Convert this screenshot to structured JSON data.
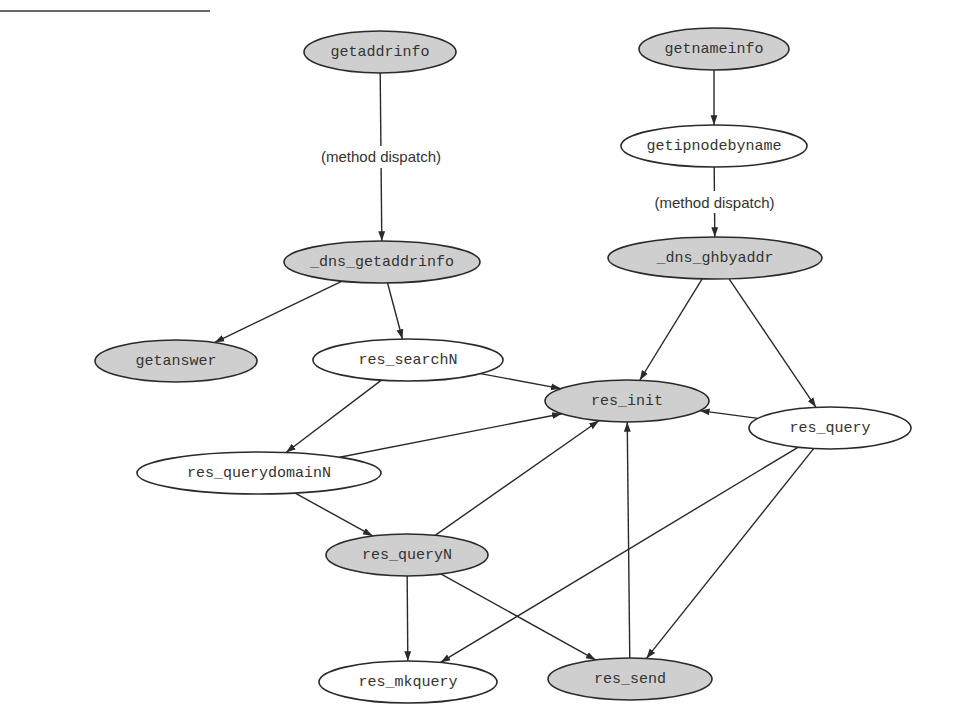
{
  "diagram": {
    "type": "call-graph",
    "colors": {
      "shaded_fill": "#cfcfcf",
      "plain_fill": "#ffffff",
      "stroke": "#2a2a2a",
      "text": "#333333"
    },
    "nodes": [
      {
        "id": "getaddrinfo",
        "label": "getaddrinfo",
        "shaded": true,
        "cx": 380,
        "cy": 52,
        "rx": 76,
        "ry": 21
      },
      {
        "id": "getnameinfo",
        "label": "getnameinfo",
        "shaded": true,
        "cx": 714,
        "cy": 49,
        "rx": 75,
        "ry": 21
      },
      {
        "id": "getipnodebyname",
        "label": "getipnodebyname",
        "shaded": false,
        "cx": 714,
        "cy": 146,
        "rx": 93,
        "ry": 21
      },
      {
        "id": "_dns_getaddrinfo",
        "label": "_dns_getaddrinfo",
        "shaded": true,
        "cx": 382,
        "cy": 262,
        "rx": 98,
        "ry": 21
      },
      {
        "id": "_dns_ghbyaddr",
        "label": "_dns_ghbyaddr",
        "shaded": true,
        "cx": 715,
        "cy": 258,
        "rx": 107,
        "ry": 21
      },
      {
        "id": "getanswer",
        "label": "getanswer",
        "shaded": true,
        "cx": 176,
        "cy": 361,
        "rx": 81,
        "ry": 21
      },
      {
        "id": "res_searchN",
        "label": "res_searchN",
        "shaded": false,
        "cx": 408,
        "cy": 360,
        "rx": 95,
        "ry": 21
      },
      {
        "id": "res_init",
        "label": "res_init",
        "shaded": true,
        "cx": 627,
        "cy": 401,
        "rx": 82,
        "ry": 21
      },
      {
        "id": "res_query",
        "label": "res_query",
        "shaded": false,
        "cx": 830,
        "cy": 428,
        "rx": 81,
        "ry": 21
      },
      {
        "id": "res_querydomainN",
        "label": "res_querydomainN",
        "shaded": false,
        "cx": 259,
        "cy": 473,
        "rx": 122,
        "ry": 21
      },
      {
        "id": "res_queryN",
        "label": "res_queryN",
        "shaded": true,
        "cx": 407,
        "cy": 555,
        "rx": 81,
        "ry": 21
      },
      {
        "id": "res_mkquery",
        "label": "res_mkquery",
        "shaded": false,
        "cx": 408,
        "cy": 682,
        "rx": 89,
        "ry": 21
      },
      {
        "id": "res_send",
        "label": "res_send",
        "shaded": true,
        "cx": 630,
        "cy": 679,
        "rx": 82,
        "ry": 21
      }
    ],
    "edges": [
      {
        "from": "getaddrinfo",
        "to": "_dns_getaddrinfo",
        "label": "(method dispatch)"
      },
      {
        "from": "getnameinfo",
        "to": "getipnodebyname",
        "label": ""
      },
      {
        "from": "getipnodebyname",
        "to": "_dns_ghbyaddr",
        "label": "(method dispatch)"
      },
      {
        "from": "_dns_getaddrinfo",
        "to": "getanswer",
        "label": ""
      },
      {
        "from": "_dns_getaddrinfo",
        "to": "res_searchN",
        "label": ""
      },
      {
        "from": "_dns_ghbyaddr",
        "to": "res_init",
        "label": ""
      },
      {
        "from": "_dns_ghbyaddr",
        "to": "res_query",
        "label": ""
      },
      {
        "from": "res_searchN",
        "to": "res_init",
        "label": ""
      },
      {
        "from": "res_searchN",
        "to": "res_querydomainN",
        "label": ""
      },
      {
        "from": "res_querydomainN",
        "to": "res_init",
        "label": ""
      },
      {
        "from": "res_querydomainN",
        "to": "res_queryN",
        "label": ""
      },
      {
        "from": "res_query",
        "to": "res_init",
        "label": ""
      },
      {
        "from": "res_query",
        "to": "res_mkquery",
        "label": ""
      },
      {
        "from": "res_query",
        "to": "res_send",
        "label": ""
      },
      {
        "from": "res_queryN",
        "to": "res_init",
        "label": ""
      },
      {
        "from": "res_queryN",
        "to": "res_mkquery",
        "label": ""
      },
      {
        "from": "res_queryN",
        "to": "res_send",
        "label": ""
      },
      {
        "from": "res_send",
        "to": "res_init",
        "label": ""
      }
    ]
  }
}
